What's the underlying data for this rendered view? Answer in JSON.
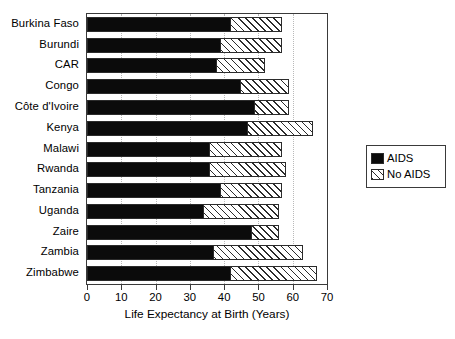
{
  "chart_data": {
    "type": "bar",
    "orientation": "horizontal",
    "title": "",
    "xlabel": "Life Expectancy at Birth (Years)",
    "ylabel": "",
    "xlim": [
      0,
      70
    ],
    "xticks": [
      0,
      10,
      20,
      30,
      40,
      50,
      60,
      70
    ],
    "xticklabels": [
      "0",
      "10",
      "20",
      "30",
      "40",
      "50",
      "60",
      "70"
    ],
    "grid": "vertical dotted gridlines at x ticks",
    "legend_position": "right, outside plot area",
    "categories": [
      "Burkina Faso",
      "Burundi",
      "CAR",
      "Congo",
      "Côte d'Ivoire",
      "Kenya",
      "Malawi",
      "Rwanda",
      "Tanzania",
      "Uganda",
      "Zaire",
      "Zambia",
      "Zimbabwe"
    ],
    "series": [
      {
        "name": "AIDS",
        "color": "#0b0b0b",
        "pattern": "solid",
        "values": [
          42,
          39,
          38,
          45,
          49,
          47,
          36,
          36,
          39,
          34,
          48,
          37,
          42
        ]
      },
      {
        "name": "No AIDS",
        "color": "#ffffff",
        "pattern": "diagonal-hatch",
        "values": [
          57,
          57,
          52,
          59,
          59,
          66,
          57,
          58,
          57,
          56,
          56,
          63,
          67
        ]
      }
    ]
  },
  "legend": {
    "entries": [
      {
        "label": "AIDS",
        "swatch": "solid-black-swatch"
      },
      {
        "label": "No AIDS",
        "swatch": "hatched-swatch"
      }
    ]
  }
}
